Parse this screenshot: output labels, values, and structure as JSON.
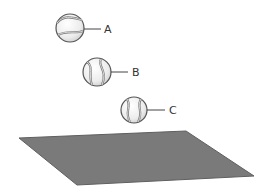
{
  "diagram": {
    "balls": [
      {
        "label": "A",
        "cx": 70,
        "cy": 28,
        "r": 14
      },
      {
        "label": "B",
        "cx": 97,
        "cy": 72,
        "r": 14
      },
      {
        "label": "C",
        "cx": 134,
        "cy": 110,
        "r": 13
      }
    ],
    "plane": {
      "color": "#7a7a7a",
      "points": "19,138 186,131 254,176 77,185"
    },
    "colors": {
      "ball_fill": "#f2f2f2",
      "ball_stroke": "#555555",
      "seam": "#777777",
      "leader": "#444444"
    }
  }
}
